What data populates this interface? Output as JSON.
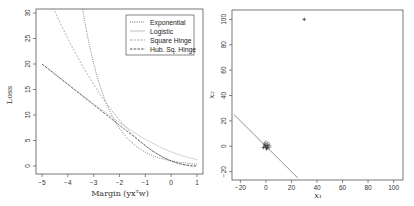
{
  "chart_data": [
    {
      "type": "line",
      "title": "",
      "xlabel": "Margin (yx^T w)",
      "ylabel": "Loss",
      "xlim": [
        -5,
        1
      ],
      "ylim": [
        0,
        30
      ],
      "x_ticks": [
        -5,
        -4,
        -3,
        -2,
        -1,
        0,
        1
      ],
      "y_ticks": [
        0,
        5,
        10,
        15,
        20,
        25,
        30
      ],
      "legend_position": "top-right",
      "grid": false,
      "series": [
        {
          "name": "Exponential",
          "style": "dotted",
          "color": "#555555",
          "x": [
            -5,
            -4.5,
            -4,
            -3.5,
            -3,
            -2.5,
            -2,
            -1.5,
            -1,
            -0.5,
            0,
            0.5,
            1
          ],
          "values": [
            148.4,
            90.0,
            54.6,
            33.1,
            20.1,
            12.2,
            7.39,
            4.48,
            2.72,
            1.65,
            1.0,
            0.61,
            0.37
          ]
        },
        {
          "name": "Logistic",
          "style": "solid-light",
          "color": "#bbbbbb",
          "x": [
            -5,
            -4,
            -3,
            -2,
            -1,
            0,
            1
          ],
          "values": [
            20.0,
            16.0,
            12.1,
            8.4,
            5.0,
            2.4,
            1.0
          ]
        },
        {
          "name": "Square Hinge",
          "style": "dashed-light",
          "color": "#999999",
          "x": [
            -5,
            -4,
            -3,
            -2,
            -1,
            0,
            1
          ],
          "values": [
            36,
            25,
            16,
            9,
            4,
            1,
            0
          ]
        },
        {
          "name": "Hub. Sq. Hinge",
          "style": "dashed",
          "color": "#444444",
          "x": [
            -5,
            -4,
            -3,
            -2,
            -1,
            0,
            1
          ],
          "values": [
            20,
            16,
            12,
            8,
            4,
            1,
            0
          ]
        }
      ]
    },
    {
      "type": "scatter",
      "title": "",
      "xlabel": "x1",
      "ylabel": "x2",
      "xlim": [
        -25,
        105
      ],
      "ylim": [
        -25,
        105
      ],
      "x_ticks": [
        -20,
        0,
        20,
        40,
        60,
        80,
        100
      ],
      "y_ticks": [
        -20,
        0,
        20,
        40,
        60,
        80,
        100
      ],
      "grid": false,
      "points": [
        {
          "x": 30,
          "y": 100,
          "marker": "+"
        },
        {
          "x": 0,
          "y": 0,
          "marker": "+"
        },
        {
          "x": 1,
          "y": -1,
          "marker": "+"
        },
        {
          "x": -1,
          "y": 1,
          "marker": "+"
        },
        {
          "x": 0.5,
          "y": -2,
          "marker": "+"
        },
        {
          "x": -2,
          "y": -1,
          "marker": "+"
        },
        {
          "x": 1.5,
          "y": 0.5,
          "marker": "+"
        },
        {
          "x": 2,
          "y": 2,
          "marker": "o"
        },
        {
          "x": 3,
          "y": 0,
          "marker": "o"
        },
        {
          "x": 0,
          "y": 3,
          "marker": "o"
        },
        {
          "x": 1,
          "y": 1,
          "marker": "o"
        },
        {
          "x": -1,
          "y": 2,
          "marker": "o"
        },
        {
          "x": 2,
          "y": -1,
          "marker": "o"
        }
      ],
      "decision_boundary": {
        "from": [
          -25,
          25
        ],
        "to": [
          25,
          -25
        ]
      }
    }
  ],
  "left": {
    "ylabel": "Loss",
    "xlabel": "Margin (yxᵀw)",
    "x_tick_labels": [
      "−5",
      "−4",
      "−3",
      "−2",
      "−1",
      "0",
      "1"
    ],
    "y_tick_labels": [
      "0",
      "5",
      "10",
      "15",
      "20",
      "25",
      "30"
    ],
    "legend": [
      "Exponential",
      "Logistic",
      "Square Hinge",
      "Hub. Sq. Hinge"
    ]
  },
  "right": {
    "ylabel": "x₂",
    "xlabel": "x₁",
    "x_tick_labels": [
      "−20",
      "0",
      "20",
      "40",
      "60",
      "80",
      "100"
    ],
    "y_tick_labels": [
      "−20",
      "0",
      "20",
      "40",
      "60",
      "80",
      "100"
    ]
  }
}
